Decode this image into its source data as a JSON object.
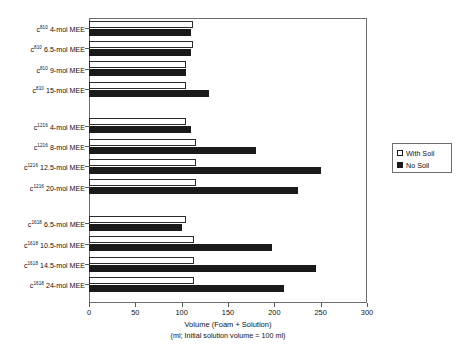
{
  "chart_data": {
    "type": "bar",
    "orientation": "horizontal",
    "title": "",
    "xlabel": "Volume (Foam + Solution)",
    "xlabel_sub": "(ml; Initial solution volume = 100 ml)",
    "ylabel": "",
    "xlim": [
      0,
      300
    ],
    "xticks": [
      0,
      50,
      100,
      150,
      200,
      250,
      300
    ],
    "xticklabels": [
      "0",
      "50",
      "100",
      "150",
      "200",
      "250",
      "300"
    ],
    "grid": false,
    "legend_position": "right",
    "legend": [
      {
        "name": "With Soil",
        "swatch": "open-square",
        "color": "#ffffff"
      },
      {
        "name": "No Soil",
        "swatch": "filled-square",
        "color": "#1a1a1a"
      }
    ],
    "series": [
      {
        "name": "With Soil",
        "key": "ws",
        "values": [
          112,
          112,
          105,
          105,
          105,
          115,
          115,
          115,
          105,
          113,
          113,
          113
        ]
      },
      {
        "name": "No Soil",
        "key": "ns",
        "values": [
          110,
          110,
          105,
          130,
          110,
          180,
          250,
          225,
          100,
          197,
          245,
          210
        ]
      }
    ],
    "categories": [
      {
        "prefix": "c",
        "sup": "810",
        "label": "4-mol MEE",
        "group": 1
      },
      {
        "prefix": "c",
        "sup": "810",
        "label": "6.5-mol MEE",
        "group": 1
      },
      {
        "prefix": "c",
        "sup": "810",
        "label": "9-mol MEE",
        "group": 1
      },
      {
        "prefix": "c",
        "sup": "810",
        "label": "15-mol MEE",
        "group": 1
      },
      {
        "prefix": "c",
        "sup": "1216",
        "label": "4-mol MEE",
        "group": 2
      },
      {
        "prefix": "c",
        "sup": "1216",
        "label": "8-mol MEE",
        "group": 2
      },
      {
        "prefix": "c",
        "sup": "1216",
        "label": "12.5-mol MEE",
        "group": 2
      },
      {
        "prefix": "c",
        "sup": "1216",
        "label": "20-mol MEE",
        "group": 2
      },
      {
        "prefix": "c",
        "sup": "1618",
        "label": "6.5-mol MEE",
        "group": 3
      },
      {
        "prefix": "c",
        "sup": "1618",
        "label": "10.5-mol MEE",
        "group": 3
      },
      {
        "prefix": "c",
        "sup": "1618",
        "label": "14.5-mol MEE",
        "group": 3
      },
      {
        "prefix": "c",
        "sup": "1618",
        "label": "24-mol MEE",
        "group": 3
      }
    ]
  },
  "colors": {
    "frame": "#6d6d6d",
    "with_soil": "#ffffff",
    "no_soil": "#1a1a1a",
    "text": "#111111",
    "background": "#ffffff"
  }
}
